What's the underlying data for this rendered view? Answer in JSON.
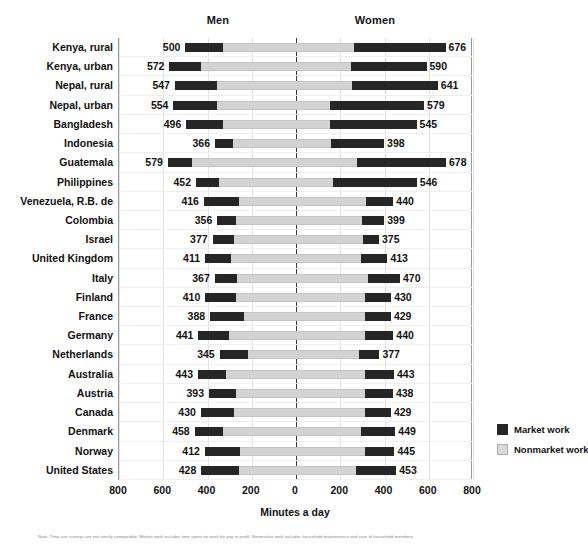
{
  "header": {
    "men_label": "Men",
    "women_label": "Women"
  },
  "axis": {
    "x_title": "Minutes a day",
    "ticks": [
      "800",
      "600",
      "400",
      "200",
      "0",
      "200",
      "400",
      "600",
      "800"
    ]
  },
  "legend": {
    "items": [
      {
        "label": "Market work",
        "color": "#262626",
        "key": "market"
      },
      {
        "label": "Nonmarket work",
        "color": "#d9d9d9",
        "key": "nonmarket"
      }
    ]
  },
  "footnote": "Note: Time-use surveys are not strictly comparable. Market work includes time spent on work for pay or profit. Nonmarket work includes household maintenance and care of household members.",
  "chart_data": {
    "type": "bar",
    "subtype": "diverging-stacked-bar",
    "title": "",
    "xlabel": "Minutes a day",
    "ylabel": "",
    "xlim": [
      -800,
      800
    ],
    "xticks": [
      -800,
      -600,
      -400,
      -200,
      0,
      200,
      400,
      600,
      800
    ],
    "xticklabels": [
      "800",
      "600",
      "400",
      "200",
      "0",
      "200",
      "400",
      "600",
      "800"
    ],
    "grid": true,
    "legend_position": "right",
    "groups": [
      "Men",
      "Women"
    ],
    "stack_components": [
      "Market work",
      "Nonmarket work"
    ],
    "categories": [
      "Kenya, rural",
      "Kenya, urban",
      "Nepal, rural",
      "Nepal, urban",
      "Bangladesh",
      "Indonesia",
      "Guatemala",
      "Philippines",
      "Venezuela, R.B. de",
      "Colombia",
      "Israel",
      "United Kingdom",
      "Italy",
      "Finland",
      "France",
      "Germany",
      "Netherlands",
      "Australia",
      "Austria",
      "Canada",
      "Denmark",
      "Norway",
      "United States"
    ],
    "rows": [
      {
        "category": "Kenya, rural",
        "men_total": 500,
        "men_market": 172,
        "men_nonmarket": 328,
        "women_total": 676,
        "women_market": 412,
        "women_nonmarket": 264
      },
      {
        "category": "Kenya, urban",
        "men_total": 572,
        "men_market": 142,
        "men_nonmarket": 430,
        "women_total": 590,
        "women_market": 340,
        "women_nonmarket": 250
      },
      {
        "category": "Nepal, rural",
        "men_total": 547,
        "men_market": 190,
        "men_nonmarket": 357,
        "women_total": 641,
        "women_market": 390,
        "women_nonmarket": 251
      },
      {
        "category": "Nepal, urban",
        "men_total": 554,
        "men_market": 195,
        "men_nonmarket": 359,
        "women_total": 579,
        "women_market": 425,
        "women_nonmarket": 154
      },
      {
        "category": "Bangladesh",
        "men_total": 496,
        "men_market": 165,
        "men_nonmarket": 331,
        "women_total": 545,
        "women_market": 393,
        "women_nonmarket": 152
      },
      {
        "category": "Indonesia",
        "men_total": 366,
        "men_market": 80,
        "men_nonmarket": 286,
        "women_total": 398,
        "women_market": 241,
        "women_nonmarket": 157
      },
      {
        "category": "Guatemala",
        "men_total": 579,
        "men_market": 108,
        "men_nonmarket": 471,
        "women_total": 678,
        "women_market": 402,
        "women_nonmarket": 276
      },
      {
        "category": "Philippines",
        "men_total": 452,
        "men_market": 103,
        "men_nonmarket": 349,
        "women_total": 546,
        "women_market": 380,
        "women_nonmarket": 166
      },
      {
        "category": "Venezuela, R.B. de",
        "men_total": 416,
        "men_market": 160,
        "men_nonmarket": 256,
        "women_total": 440,
        "women_market": 125,
        "women_nonmarket": 315
      },
      {
        "category": "Colombia",
        "men_total": 356,
        "men_market": 85,
        "men_nonmarket": 271,
        "women_total": 399,
        "women_market": 100,
        "women_nonmarket": 299
      },
      {
        "category": "Israel",
        "men_total": 377,
        "men_market": 96,
        "men_nonmarket": 281,
        "women_total": 375,
        "women_market": 72,
        "women_nonmarket": 303
      },
      {
        "category": "United Kingdom",
        "men_total": 411,
        "men_market": 116,
        "men_nonmarket": 295,
        "women_total": 413,
        "women_market": 120,
        "women_nonmarket": 293
      },
      {
        "category": "Italy",
        "men_total": 367,
        "men_market": 100,
        "men_nonmarket": 267,
        "women_total": 470,
        "women_market": 143,
        "women_nonmarket": 327
      },
      {
        "category": "Finland",
        "men_total": 410,
        "men_market": 138,
        "men_nonmarket": 272,
        "women_total": 430,
        "women_market": 118,
        "women_nonmarket": 312
      },
      {
        "category": "France",
        "men_total": 388,
        "men_market": 152,
        "men_nonmarket": 236,
        "women_total": 429,
        "women_market": 118,
        "women_nonmarket": 311
      },
      {
        "category": "Germany",
        "men_total": 441,
        "men_market": 136,
        "men_nonmarket": 305,
        "women_total": 440,
        "women_market": 128,
        "women_nonmarket": 312
      },
      {
        "category": "Netherlands",
        "men_total": 345,
        "men_market": 128,
        "men_nonmarket": 217,
        "women_total": 377,
        "women_market": 90,
        "women_nonmarket": 287
      },
      {
        "category": "Australia",
        "men_total": 443,
        "men_market": 126,
        "men_nonmarket": 317,
        "women_total": 443,
        "women_market": 131,
        "women_nonmarket": 312
      },
      {
        "category": "Austria",
        "men_total": 393,
        "men_market": 124,
        "men_nonmarket": 269,
        "women_total": 438,
        "women_market": 126,
        "women_nonmarket": 312
      },
      {
        "category": "Canada",
        "men_total": 430,
        "men_market": 150,
        "men_nonmarket": 280,
        "women_total": 429,
        "women_market": 118,
        "women_nonmarket": 311
      },
      {
        "category": "Denmark",
        "men_total": 458,
        "men_market": 128,
        "men_nonmarket": 330,
        "women_total": 449,
        "women_market": 155,
        "women_nonmarket": 294
      },
      {
        "category": "Norway",
        "men_total": 412,
        "men_market": 160,
        "men_nonmarket": 252,
        "women_total": 445,
        "women_market": 135,
        "women_nonmarket": 310
      },
      {
        "category": "United States",
        "men_total": 428,
        "men_market": 172,
        "men_nonmarket": 256,
        "women_total": 453,
        "women_market": 180,
        "women_nonmarket": 273
      }
    ]
  }
}
